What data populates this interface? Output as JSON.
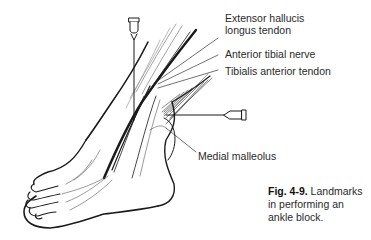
{
  "figure": {
    "labels": [
      {
        "id": "ehl",
        "line1": "Extensor hallucis",
        "line2": "longus tendon"
      },
      {
        "id": "atn",
        "line1": "Anterior tibial nerve"
      },
      {
        "id": "tat",
        "line1": "Tibialis anterior tendon"
      },
      {
        "id": "mm",
        "line1": "Medial malleolus"
      }
    ],
    "caption": {
      "number": "Fig. 4-9.",
      "text": "Landmarks in performing an ankle block."
    },
    "colors": {
      "ink": "#1a1a1a",
      "text": "#2a2a2a",
      "background": "#ffffff"
    }
  }
}
